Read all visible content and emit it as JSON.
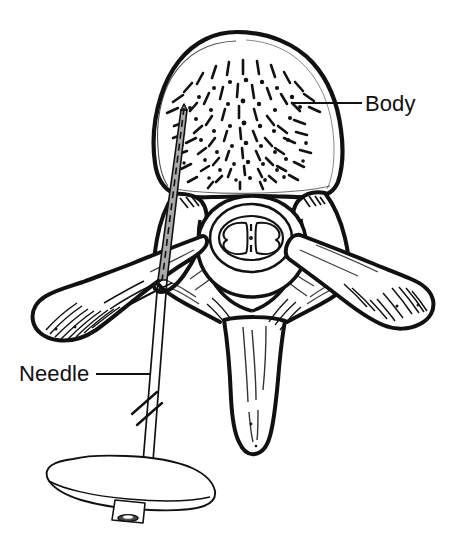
{
  "figure": {
    "kind": "medical-line-illustration",
    "background_color": "#ffffff",
    "ink_color": "#111111",
    "needle_fill_color": "#a9a9a9",
    "labels": [
      {
        "id": "body",
        "text": "Body",
        "text_x": 365,
        "text_y": 111,
        "leader": {
          "x1": 293,
          "y1": 103,
          "x2": 362,
          "y2": 103
        },
        "anchor_part": "vertebral-body"
      },
      {
        "id": "needle",
        "text": "Needle",
        "text_x": 19,
        "text_y": 381,
        "leader": {
          "x1": 96,
          "y1": 374,
          "x2": 150,
          "y2": 374
        },
        "anchor_part": "needle-shaft"
      }
    ],
    "parts": [
      {
        "id": "vertebral-body",
        "name": "Body"
      },
      {
        "id": "trabecular-texture",
        "name": "Cancellous bone trabeculae"
      },
      {
        "id": "vertebral-foramen",
        "name": "Vertebral foramen"
      },
      {
        "id": "spinal-cord",
        "name": "Spinal cord"
      },
      {
        "id": "left-transverse-process",
        "name": "Left transverse process"
      },
      {
        "id": "right-transverse-process",
        "name": "Right transverse process"
      },
      {
        "id": "spinous-process",
        "name": "Spinous process"
      },
      {
        "id": "needle-shaft",
        "name": "Needle"
      },
      {
        "id": "needle-hub",
        "name": "Needle hub"
      },
      {
        "id": "needle-break-marks",
        "name": "Shaft break marks"
      }
    ]
  }
}
